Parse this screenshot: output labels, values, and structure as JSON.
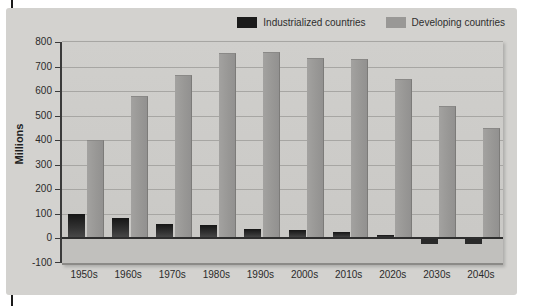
{
  "legend": {
    "items": [
      {
        "label": "Industrialized countries",
        "color": "#1b1b1b"
      },
      {
        "label": "Developing countries",
        "color": "#999896"
      }
    ]
  },
  "chart_data": {
    "type": "bar",
    "title": "",
    "xlabel": "",
    "ylabel": "Millions",
    "categories": [
      "1950s",
      "1960s",
      "1970s",
      "1980s",
      "1990s",
      "2000s",
      "2010s",
      "2020s",
      "2030s",
      "2040s"
    ],
    "series": [
      {
        "name": "Industrialized countries",
        "color": "#1b1b1b",
        "values": [
          100,
          85,
          60,
          55,
          40,
          35,
          25,
          15,
          -20,
          -20
        ]
      },
      {
        "name": "Developing countries",
        "color": "#999896",
        "values": [
          400,
          580,
          665,
          755,
          760,
          735,
          730,
          650,
          540,
          450
        ]
      }
    ],
    "ylim": [
      -100,
      800
    ],
    "yticks": [
      800,
      700,
      600,
      500,
      400,
      300,
      200,
      100,
      0,
      -100
    ],
    "grid": true,
    "legend_position": "top-right"
  }
}
